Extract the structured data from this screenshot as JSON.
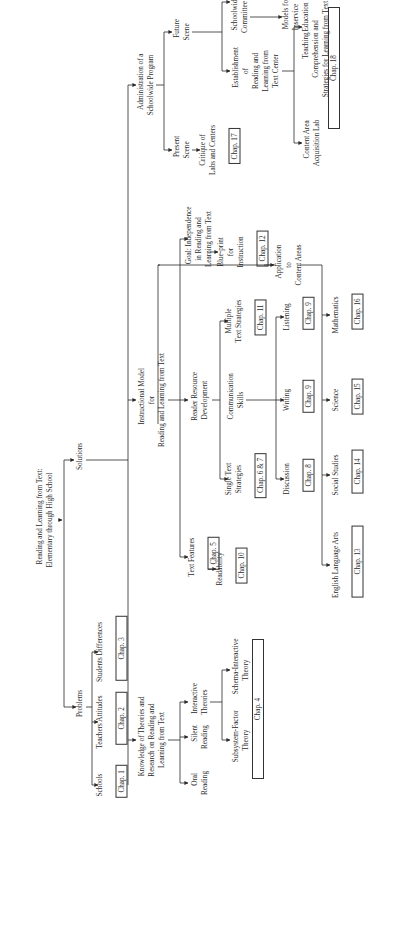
{
  "diagram": {
    "orientation": "rotated -90deg",
    "root": {
      "label": "Reading and Learning from Text:\nElementary through High School"
    },
    "problems": {
      "label": "Problems",
      "children": [
        {
          "label": "Schools",
          "chap": "Chap. 1"
        },
        {
          "label": "Teachers Attitudes",
          "chap": "Chap. 2"
        },
        {
          "label": "Students Differences",
          "chap": "Chap. 3"
        }
      ]
    },
    "solutions": {
      "label": "Solutions",
      "knowledge": {
        "label": "Knowledge of Theories and\nResearch on Reading and\nLearning from Text",
        "oral": "Oral\nReading",
        "silent": "Silent\nReading",
        "interactive": "Interactive\nTheories",
        "subsystem": "Subsystem-Factor\nTheory",
        "schema": "Schema-Interactive\nTheory",
        "chap": "Chap. 4"
      },
      "instructional": {
        "label": "Instructional Model\nfor\nReading and Learning from Text",
        "text_features": {
          "label": "Text Features",
          "chap": "Chap. 5"
        },
        "readability": {
          "label": "Readability",
          "chap": "Chap. 10"
        },
        "reader_resource": {
          "label": "Reader Resource\nDevelopment"
        },
        "single_text": {
          "label": "Single Text\nStrategies",
          "chap": "Chap. 6 & 7"
        },
        "communication": {
          "label": "Communication\nSkills"
        },
        "multiple_text": {
          "label": "Multiple\nText Strategies",
          "chap": "Chap. 11"
        },
        "discussion": {
          "label": "Discussion",
          "chap": "Chap. 8"
        },
        "writing": {
          "label": "Writing",
          "chap": "Chap. 9"
        },
        "listening": {
          "label": "Listening",
          "chap": "Chap. 9"
        },
        "goal": {
          "label": "Goal: Independence\nin Reading and\nLearning from Text"
        },
        "blueprint": {
          "label": "Blue-print\nfor\nInstruction",
          "chap": "Chap. 12"
        },
        "application": {
          "label": "Application\nto\nContent Areas",
          "children": [
            {
              "label": "English Language Arts",
              "chap": "Chap. 13"
            },
            {
              "label": "Social Studies",
              "chap": "Chap. 14"
            },
            {
              "label": "Science",
              "chap": "Chap. 15"
            },
            {
              "label": "Mathematics",
              "chap": "Chap. 16"
            }
          ]
        }
      },
      "administration": {
        "label": "Administration of a\nSchoolwide Program",
        "present": {
          "label": "Present\nScene"
        },
        "critique": {
          "label": "Critique of\nLabs and Centers",
          "chap": "Chap. 17"
        },
        "future": {
          "label": "Future\nScene"
        },
        "establishment": {
          "label": "Establishment\nof\nReading and\nLearning from\nText Center"
        },
        "committee": {
          "label": "Schoolwide\nCommittee"
        },
        "models": {
          "label": "Models for\nInservice\nEducation"
        },
        "content_lab": {
          "label": "Content Area\nAcquisition Lab"
        },
        "teaching": {
          "label": "Teaching\nComprehension and\nStrategies for Learning from Text"
        },
        "chap": "Chap. 18"
      }
    }
  },
  "colors": {
    "ink": "#2a2a2a",
    "paper": "#ffffff"
  }
}
